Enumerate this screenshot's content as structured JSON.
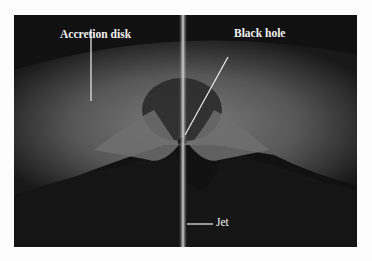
{
  "figure": {
    "labels": {
      "accretion_disk": "Accretion disk",
      "black_hole": "Black hole",
      "jet": "Jet"
    },
    "colors": {
      "background": "#111111",
      "disk": "#7a7a7a",
      "jet": "#d8d8d8",
      "label": "#f2f2f2"
    }
  }
}
